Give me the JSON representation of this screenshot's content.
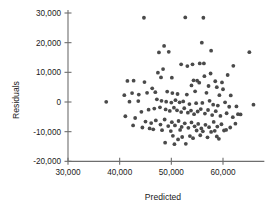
{
  "chart_data": {
    "type": "scatter",
    "title": "",
    "xlabel": "Predicted",
    "ylabel": "Residuals",
    "xlim": [
      26000,
      68000
    ],
    "ylim": [
      -20000,
      31000
    ],
    "xticks": [
      30000,
      40000,
      50000,
      60000
    ],
    "xtick_labels": [
      "30,000",
      "40,000",
      "50,000",
      "60,000"
    ],
    "yticks": [
      -20000,
      -10000,
      0,
      10000,
      20000,
      30000
    ],
    "ytick_labels": [
      "-20,000",
      "-10,000",
      "0",
      "10,000",
      "20,000",
      "30,000"
    ],
    "grid": false,
    "legend": null,
    "point_color": "#4a4a4a",
    "point_radius": 1.9,
    "n_points": 142,
    "points": [
      [
        44700,
        28400
      ],
      [
        52700,
        28500
      ],
      [
        56200,
        28400
      ],
      [
        55900,
        20000
      ],
      [
        48600,
        18900
      ],
      [
        65100,
        16800
      ],
      [
        57700,
        17300
      ],
      [
        47600,
        16700
      ],
      [
        49500,
        16900
      ],
      [
        51900,
        12700
      ],
      [
        54100,
        12700
      ],
      [
        55500,
        13000
      ],
      [
        56300,
        13000
      ],
      [
        53100,
        12100
      ],
      [
        62000,
        12200
      ],
      [
        48400,
        11100
      ],
      [
        47400,
        9900
      ],
      [
        57600,
        9600
      ],
      [
        56400,
        8700
      ],
      [
        60900,
        9100
      ],
      [
        50100,
        8200
      ],
      [
        54300,
        7300
      ],
      [
        55000,
        7200
      ],
      [
        55400,
        6500
      ],
      [
        58500,
        7000
      ],
      [
        59800,
        6600
      ],
      [
        41500,
        7100
      ],
      [
        42700,
        7200
      ],
      [
        44800,
        6700
      ],
      [
        48000,
        8300
      ],
      [
        53900,
        5600
      ],
      [
        57200,
        5400
      ],
      [
        58800,
        5000
      ],
      [
        60000,
        4300
      ],
      [
        46300,
        4600
      ],
      [
        45300,
        3100
      ],
      [
        46900,
        3300
      ],
      [
        49200,
        3500
      ],
      [
        50200,
        3000
      ],
      [
        51200,
        2700
      ],
      [
        53000,
        2500
      ],
      [
        54600,
        3600
      ],
      [
        56800,
        3100
      ],
      [
        59300,
        2300
      ],
      [
        61500,
        2200
      ],
      [
        42400,
        3000
      ],
      [
        43700,
        2500
      ],
      [
        40900,
        2300
      ],
      [
        37400,
        50
      ],
      [
        41900,
        100
      ],
      [
        43600,
        300
      ],
      [
        47200,
        900
      ],
      [
        48100,
        400
      ],
      [
        49000,
        100
      ],
      [
        50000,
        -200
      ],
      [
        50800,
        600
      ],
      [
        51600,
        -100
      ],
      [
        52300,
        200
      ],
      [
        53500,
        -700
      ],
      [
        54800,
        -400
      ],
      [
        56000,
        -300
      ],
      [
        57400,
        400
      ],
      [
        58100,
        -900
      ],
      [
        59000,
        -1200
      ],
      [
        60400,
        -100
      ],
      [
        61200,
        -1600
      ],
      [
        62600,
        -1500
      ],
      [
        65900,
        -900
      ],
      [
        44200,
        -3300
      ],
      [
        45600,
        -2600
      ],
      [
        46700,
        -2200
      ],
      [
        47800,
        -1800
      ],
      [
        48900,
        -2500
      ],
      [
        49700,
        -3000
      ],
      [
        50500,
        -1900
      ],
      [
        51100,
        -2800
      ],
      [
        51900,
        -3400
      ],
      [
        52500,
        -2100
      ],
      [
        53200,
        -3600
      ],
      [
        53800,
        -2900
      ],
      [
        54400,
        -4100
      ],
      [
        55100,
        -3200
      ],
      [
        55700,
        -2400
      ],
      [
        56500,
        -3900
      ],
      [
        57100,
        -2700
      ],
      [
        57900,
        -4400
      ],
      [
        58600,
        -3100
      ],
      [
        59500,
        -4700
      ],
      [
        60700,
        -3800
      ],
      [
        61900,
        -5100
      ],
      [
        63400,
        -4200
      ],
      [
        41100,
        -4800
      ],
      [
        43000,
        -5400
      ],
      [
        45000,
        -6600
      ],
      [
        46100,
        -7100
      ],
      [
        47000,
        -6200
      ],
      [
        47900,
        -7600
      ],
      [
        48700,
        -5900
      ],
      [
        49400,
        -8100
      ],
      [
        50100,
        -6800
      ],
      [
        50700,
        -7900
      ],
      [
        51400,
        -6400
      ],
      [
        52000,
        -8400
      ],
      [
        52600,
        -7200
      ],
      [
        53300,
        -8700
      ],
      [
        53900,
        -6900
      ],
      [
        54500,
        -8200
      ],
      [
        55200,
        -7400
      ],
      [
        55800,
        -8900
      ],
      [
        56600,
        -7700
      ],
      [
        57300,
        -8500
      ],
      [
        58200,
        -6700
      ],
      [
        58900,
        -8300
      ],
      [
        59700,
        -7500
      ],
      [
        60600,
        -9400
      ],
      [
        61400,
        -8600
      ],
      [
        62400,
        -7300
      ],
      [
        44400,
        -8600
      ],
      [
        45800,
        -8900
      ],
      [
        46500,
        -9200
      ],
      [
        42600,
        -7900
      ],
      [
        48200,
        -9500
      ],
      [
        49900,
        -9800
      ],
      [
        51700,
        -9400
      ],
      [
        54900,
        -9600
      ],
      [
        56100,
        -9900
      ],
      [
        57700,
        -10100
      ],
      [
        58400,
        -9700
      ],
      [
        60200,
        -9600
      ],
      [
        62900,
        -4100
      ],
      [
        50300,
        -11400
      ],
      [
        52100,
        -11800
      ],
      [
        53600,
        -11500
      ],
      [
        55600,
        -11200
      ],
      [
        57000,
        -11900
      ],
      [
        58800,
        -11600
      ],
      [
        48800,
        -13700
      ],
      [
        50600,
        -14200
      ],
      [
        52800,
        -14100
      ],
      [
        51300,
        -12600
      ],
      [
        54200,
        -12200
      ],
      [
        59200,
        -12400
      ]
    ]
  },
  "axis": {
    "y_title": "Residuals",
    "x_title": "Predicted"
  }
}
